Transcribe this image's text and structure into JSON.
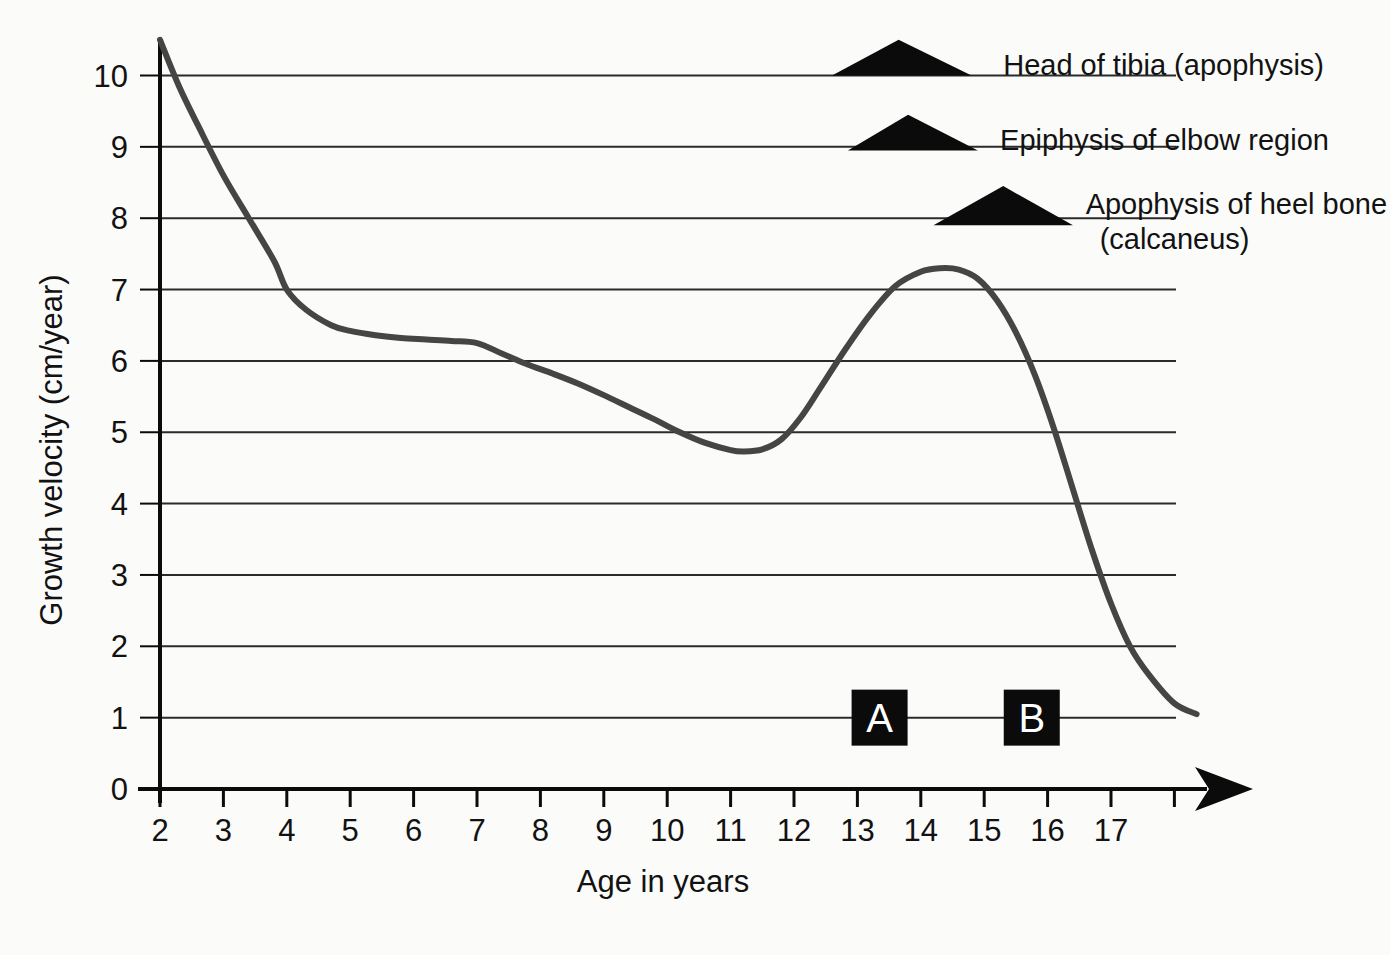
{
  "chart_data": {
    "type": "line",
    "title": "",
    "xlabel": "Age in years",
    "ylabel": "Growth velocity (cm/year)",
    "xlim": [
      2,
      18.4
    ],
    "ylim": [
      0,
      10.7
    ],
    "grid": "horizontal",
    "legend": "none",
    "x_ticks": [
      "2",
      "3",
      "4",
      "5",
      "6",
      "7",
      "8",
      "9",
      "10",
      "11",
      "12",
      "13",
      "14",
      "15",
      "16",
      "17"
    ],
    "y_ticks": [
      "0",
      "1",
      "2",
      "3",
      "4",
      "5",
      "6",
      "7",
      "8",
      "9",
      "10"
    ],
    "series": [
      {
        "name": "Growth velocity",
        "color": "#454545",
        "x": [
          2.0,
          2.3,
          2.6,
          3.0,
          3.4,
          3.8,
          4.0,
          4.3,
          4.7,
          5.0,
          5.4,
          5.8,
          6.2,
          6.6,
          7.0,
          7.4,
          7.8,
          8.2,
          8.6,
          9.0,
          9.4,
          9.8,
          10.2,
          10.6,
          11.0,
          11.2,
          11.5,
          11.8,
          12.1,
          12.4,
          12.8,
          13.2,
          13.6,
          14.0,
          14.3,
          14.6,
          14.9,
          15.2,
          15.5,
          15.8,
          16.1,
          16.4,
          16.7,
          17.0,
          17.3,
          17.6,
          18.0,
          18.35
        ],
        "y": [
          10.5,
          9.85,
          9.3,
          8.6,
          8.0,
          7.4,
          7.0,
          6.72,
          6.5,
          6.42,
          6.36,
          6.32,
          6.3,
          6.28,
          6.25,
          6.1,
          5.95,
          5.82,
          5.68,
          5.52,
          5.35,
          5.18,
          5.0,
          4.85,
          4.75,
          4.73,
          4.76,
          4.9,
          5.2,
          5.6,
          6.15,
          6.65,
          7.05,
          7.25,
          7.3,
          7.28,
          7.15,
          6.85,
          6.4,
          5.8,
          5.05,
          4.2,
          3.35,
          2.6,
          2.0,
          1.6,
          1.2,
          1.05
        ]
      }
    ],
    "annotations": [
      {
        "id": "head-of-tibia",
        "label": "Head of tibia (apophysis)",
        "marker": "triangle",
        "baseline_value": 10,
        "x_start": 12.6,
        "x_end": 14.8,
        "apex_x": 13.65,
        "apex_value": 10.5,
        "label_x": 15.3,
        "label_value": 10.15
      },
      {
        "id": "epiphysis-of-elbow-region",
        "label": "Epiphysis of elbow region",
        "marker": "triangle",
        "baseline_value": 8.95,
        "x_start": 12.85,
        "x_end": 14.9,
        "apex_x": 13.8,
        "apex_value": 9.45,
        "label_x": 15.25,
        "label_value": 9.1
      },
      {
        "id": "apophysis-of-heel-bone",
        "label": "Apophysis of heel bone",
        "label_line2": "(calcaneus)",
        "marker": "triangle",
        "baseline_value": 7.9,
        "x_start": 14.2,
        "x_end": 16.4,
        "apex_x": 15.3,
        "apex_value": 8.45,
        "label_x": 16.6,
        "label_value": 8.2
      }
    ],
    "markers": [
      {
        "id": "marker-a",
        "label": "A",
        "x": 13.35,
        "value": 1,
        "box_color": "#0b0b0b",
        "text_color": "#ffffff"
      },
      {
        "id": "marker-b",
        "label": "B",
        "x": 15.75,
        "value": 1,
        "box_color": "#0b0b0b",
        "text_color": "#ffffff"
      }
    ],
    "axis_arrow": true,
    "colors": {
      "background": "#fbfbfa",
      "curve": "#454545",
      "gridline": "#2b2b2b",
      "axis": "#0b0b0b",
      "text": "#121212"
    }
  }
}
